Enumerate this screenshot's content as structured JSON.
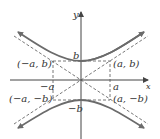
{
  "diagram": {
    "type": "hyperbola",
    "axes": {
      "x_label": "x",
      "y_label": "y"
    },
    "labels": {
      "b": "b",
      "neg_b": "−b",
      "a": "a",
      "neg_a": "−a",
      "pt_neg_a_b": "(−a, b)",
      "pt_a_b": "(a, b)",
      "pt_neg_a_neg_b": "(−a, −b)",
      "pt_a_neg_b": "(a, −b)"
    },
    "colors": {
      "curve": "#6b6b6b",
      "axis": "#444444",
      "dashed": "#555555",
      "text": "#333333"
    }
  }
}
